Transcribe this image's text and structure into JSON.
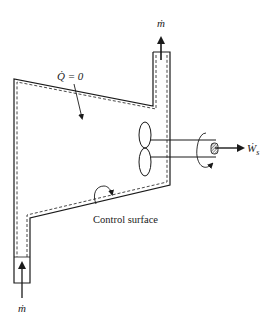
{
  "diagram": {
    "type": "control-volume-schematic",
    "labels": {
      "mass_flow_out": "ṁ",
      "mass_flow_in": "ṁ",
      "heat_rate": "Q̇ = 0",
      "shaft_work": "Ẇ",
      "shaft_work_sub": "s",
      "control_surface": "Control surface"
    },
    "colors": {
      "line": "#1a1a1a",
      "background": "#ffffff"
    }
  }
}
